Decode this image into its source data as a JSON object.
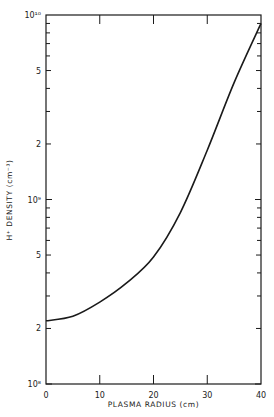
{
  "chart_data": {
    "type": "line",
    "title": "",
    "xlabel": "PLASMA RADIUS (cm)",
    "ylabel": "H⁺ DENSITY (cm⁻³)",
    "xlim": [
      0,
      40
    ],
    "ylim": [
      100000000.0,
      10000000000.0
    ],
    "yscale": "log",
    "grid": false,
    "legend": null,
    "x_ticks": [
      0,
      10,
      20,
      30,
      40
    ],
    "x_tick_labels": [
      "0",
      "10",
      "20",
      "30",
      "40"
    ],
    "y_tick_labels": [
      {
        "value": 100000000.0,
        "label": "10⁸"
      },
      {
        "value": 200000000.0,
        "label": "2"
      },
      {
        "value": 500000000.0,
        "label": "5"
      },
      {
        "value": 1000000000.0,
        "label": "10⁹"
      },
      {
        "value": 2000000000.0,
        "label": "2"
      },
      {
        "value": 5000000000.0,
        "label": "5"
      },
      {
        "value": 10000000000.0,
        "label": "10¹⁰"
      }
    ],
    "series": [
      {
        "name": "H+ density",
        "x": [
          0,
          5,
          10,
          15,
          20,
          25,
          30,
          35,
          40
        ],
        "values": [
          220000000.0,
          233000000.0,
          278000000.0,
          353000000.0,
          488000000.0,
          850000000.0,
          1850000000.0,
          4300000000.0,
          9000000000.0
        ]
      }
    ]
  }
}
